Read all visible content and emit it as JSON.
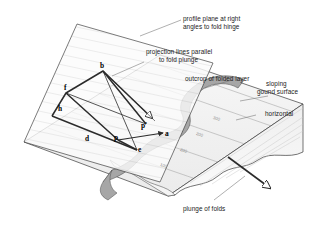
{
  "figure": {
    "title_semantic": "down-plunge projection of folded layer onto profile plane",
    "background_color": "#ffffff",
    "line_color": "#333333",
    "layer_fill_color": "#a6a6a6",
    "ground_fill_color": "#f2f2f2",
    "profile_plane_fill": "#fbfbfb",
    "hatch_color": "#b0b0b0"
  },
  "annotations": {
    "profile_plane": {
      "line1": "profile plane at right",
      "line2": "angles to fold hinge"
    },
    "projection_lines": {
      "line1": "projection lines parallel",
      "line2": "to fold plunge"
    },
    "outcrop": "outcrop of folded layer",
    "sloping_ground": {
      "line1": "sloping",
      "line2": "gound surface"
    },
    "horizontal": "horizontal",
    "plunge_of_folds": "plunge of folds"
  },
  "point_labels": {
    "b": "b",
    "f": "f",
    "h": "h",
    "d": "d",
    "p": "p",
    "p_prime": "p'",
    "a": "a",
    "e": "e"
  },
  "contour_labels": {
    "c1": "300",
    "c2": "200",
    "c3": "200",
    "c4": "100"
  }
}
